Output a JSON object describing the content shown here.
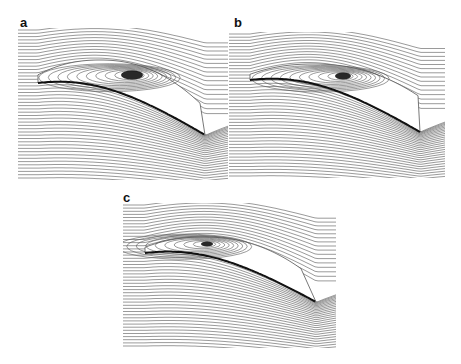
{
  "figure": {
    "panels": [
      {
        "label": "a",
        "label_pos": [
          20,
          16
        ],
        "box": [
          18,
          28,
          210,
          152
        ],
        "le": [
          38,
          83
        ],
        "te": [
          205,
          135
        ],
        "vortex": [
          132,
          75
        ],
        "vortex_size": [
          22,
          9
        ],
        "bubble_top": 60,
        "wake_x": [
          175,
          228
        ]
      },
      {
        "label": "b",
        "label_pos": [
          234,
          16
        ],
        "box": [
          229,
          32,
          216,
          146
        ],
        "le": [
          250,
          80
        ],
        "te": [
          420,
          132
        ],
        "vortex": [
          343,
          76
        ],
        "vortex_size": [
          16,
          7
        ],
        "bubble_top": 64,
        "wake_x": [
          390,
          445
        ]
      },
      {
        "label": "c",
        "label_pos": [
          123,
          191
        ],
        "box": [
          123,
          203,
          215,
          145
        ],
        "le": [
          145,
          253
        ],
        "te": [
          316,
          302
        ],
        "vortex": [
          207,
          244
        ],
        "vortex_size": [
          12,
          5
        ],
        "bubble_top": 237,
        "wake_x": [
          275,
          338
        ]
      }
    ],
    "colors": {
      "stream": "#555555",
      "airfoil": "#111111",
      "vortex": "#111111"
    }
  }
}
